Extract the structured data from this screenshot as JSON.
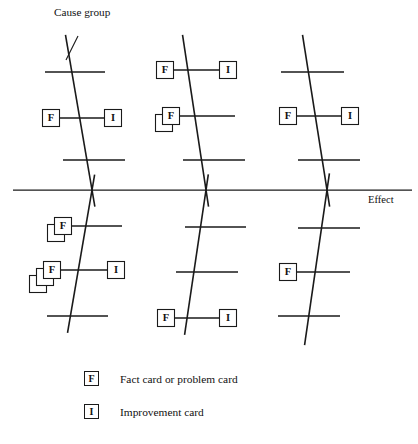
{
  "diagram": {
    "type": "fishbone-ishikawa",
    "title_label": "Cause group",
    "effect_label": "Effect",
    "card_letters": {
      "fact": "F",
      "improvement": "I"
    },
    "main_spine": {
      "x1": 13,
      "y1": 190,
      "x2": 412,
      "y2": 190
    },
    "cause_group_pointer": {
      "x1": 78,
      "y1": 36,
      "x2": 66,
      "y2": 60
    },
    "cause_groups": [
      {
        "name": "upper-left",
        "position": "above",
        "spine": {
          "x_top": 66,
          "y_top": 38,
          "x_cross": 92,
          "y_cross": 190
        },
        "branches": [
          {
            "y": 72,
            "x_start": 45,
            "x_end": 105,
            "left_card": "",
            "right_card": "",
            "left_stack": 0
          },
          {
            "y": 118,
            "x_start": 51,
            "x_end": 113,
            "left_card": "F",
            "right_card": "I",
            "left_stack": 1
          },
          {
            "y": 160,
            "x_start": 63,
            "x_end": 125,
            "left_card": "",
            "right_card": "",
            "left_stack": 0
          }
        ]
      },
      {
        "name": "upper-middle",
        "position": "above",
        "spine": {
          "x_top": 183,
          "y_top": 38,
          "x_cross": 206,
          "y_cross": 190
        },
        "branches": [
          {
            "y": 70,
            "x_start": 165,
            "x_end": 228,
            "left_card": "F",
            "right_card": "I",
            "left_stack": 1
          },
          {
            "y": 116,
            "x_start": 171,
            "x_end": 235,
            "left_card": "F",
            "right_card": "",
            "left_stack": 2
          },
          {
            "y": 160,
            "x_start": 183,
            "x_end": 245,
            "left_card": "",
            "right_card": "",
            "left_stack": 0
          }
        ]
      },
      {
        "name": "upper-right",
        "position": "above",
        "spine": {
          "x_top": 303,
          "y_top": 38,
          "x_cross": 327,
          "y_cross": 190
        },
        "branches": [
          {
            "y": 72,
            "x_start": 281,
            "x_end": 344,
            "left_card": "",
            "right_card": "",
            "left_stack": 0
          },
          {
            "y": 116,
            "x_start": 288,
            "x_end": 350,
            "left_card": "F",
            "right_card": "I",
            "left_stack": 1
          },
          {
            "y": 160,
            "x_start": 298,
            "x_end": 360,
            "left_card": "",
            "right_card": "",
            "left_stack": 0
          }
        ]
      },
      {
        "name": "lower-left",
        "position": "below",
        "spine": {
          "x_bottom": 68,
          "y_bottom": 330,
          "x_cross": 92,
          "y_cross": 190
        },
        "branches": [
          {
            "y": 226,
            "x_start": 63,
            "x_end": 122,
            "left_card": "F",
            "right_card": "",
            "left_stack": 2
          },
          {
            "y": 270,
            "x_start": 52,
            "x_end": 116,
            "left_card": "F",
            "right_card": "I",
            "left_stack": 3
          },
          {
            "y": 316,
            "x_start": 47,
            "x_end": 108,
            "left_card": "",
            "right_card": "",
            "left_stack": 0
          }
        ]
      },
      {
        "name": "lower-middle",
        "position": "below",
        "spine": {
          "x_bottom": 185,
          "y_bottom": 332,
          "x_cross": 206,
          "y_cross": 190
        },
        "branches": [
          {
            "y": 227,
            "x_start": 185,
            "x_end": 246,
            "left_card": "",
            "right_card": "",
            "left_stack": 0
          },
          {
            "y": 272,
            "x_start": 176,
            "x_end": 238,
            "left_card": "",
            "right_card": "",
            "left_stack": 0
          },
          {
            "y": 318,
            "x_start": 166,
            "x_end": 228,
            "left_card": "F",
            "right_card": "I",
            "left_stack": 1
          }
        ]
      },
      {
        "name": "lower-right",
        "position": "below",
        "spine": {
          "x_bottom": 305,
          "y_bottom": 342,
          "x_cross": 327,
          "y_cross": 190
        },
        "branches": [
          {
            "y": 228,
            "x_start": 298,
            "x_end": 360,
            "left_card": "",
            "right_card": "",
            "left_stack": 0
          },
          {
            "y": 272,
            "x_start": 288,
            "x_end": 350,
            "left_card": "F",
            "right_card": "",
            "left_stack": 1
          },
          {
            "y": 316,
            "x_start": 278,
            "x_end": 340,
            "left_card": "",
            "right_card": "",
            "left_stack": 0
          }
        ]
      }
    ]
  },
  "legend": {
    "fact": {
      "symbol": "F",
      "text": "Fact card or problem card"
    },
    "improvement": {
      "symbol": "I",
      "text": "Improvement card"
    }
  },
  "colors": {
    "ink": "#1a1a1a",
    "background": "#ffffff"
  }
}
